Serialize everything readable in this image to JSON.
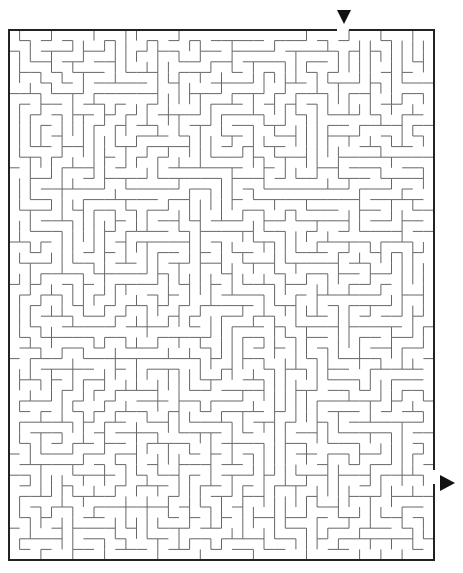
{
  "puzzle": {
    "title": "",
    "type": "rectangular-maze",
    "grid": {
      "cols": 40,
      "rows": 50
    },
    "frame": {
      "left": 9,
      "top": 30,
      "right": 434,
      "bottom": 560
    },
    "entrance": {
      "side": "top",
      "marker": "down-arrow-icon",
      "x": 343,
      "y": 17
    },
    "exit": {
      "side": "right",
      "marker": "right-arrow-icon",
      "x": 440,
      "y": 475
    },
    "colors": {
      "wall": "#666666",
      "border": "#222222",
      "arrow": "#111111",
      "background": "#ffffff"
    },
    "seed": 7919
  }
}
